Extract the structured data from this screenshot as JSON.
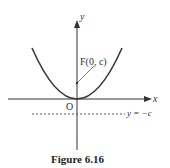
{
  "figure": {
    "caption": "Figure 6.16",
    "axis_x_label": "x",
    "axis_y_label": "y",
    "origin_label": "O",
    "focus_label": "F(0, c)",
    "directrix_label": "y = −c",
    "curve": "parabola x^2 = 4cy, vertex at origin, opening upward",
    "colors": {
      "curve": "#3a3a3a",
      "axes": "#333333",
      "directrix": "#555555"
    }
  }
}
